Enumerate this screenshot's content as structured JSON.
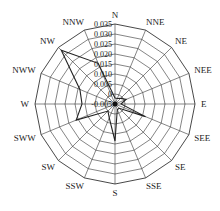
{
  "chart_data": {
    "type": "radar",
    "title": "",
    "categories": [
      "N",
      "NNE",
      "NE",
      "NEE",
      "E",
      "SEE",
      "SE",
      "SSE",
      "S",
      "SSW",
      "SW",
      "SWW",
      "W",
      "NWW",
      "NW",
      "NNW"
    ],
    "series": [
      {
        "name": "wind frequency",
        "values": [
          -0.002,
          -0.002,
          -0.001,
          0.001,
          -0.002,
          0.0115,
          -0.002,
          -0.002,
          0.0135,
          0.0025,
          0.0,
          0.016,
          0.0115,
          0.014,
          0.033,
          0.017
        ]
      }
    ],
    "radial_ticks": [
      "-0.005",
      "0",
      "0.005",
      "0.010",
      "0.015",
      "0.020",
      "0.025",
      "0.030",
      "0.035"
    ],
    "rlim": [
      -0.005,
      0.035
    ],
    "grid": true,
    "legend": "none",
    "caption": ""
  },
  "colors": {
    "line": "#222222",
    "grid": "#333333"
  }
}
